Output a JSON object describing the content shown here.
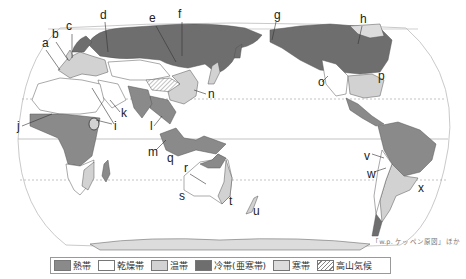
{
  "map": {
    "title": "Köppen climate zones world map",
    "projection": "Pacific-centered pseudo-cylindrical",
    "lines": [
      "equator",
      "tropic-of-cancer",
      "tropic-of-capricorn",
      "arctic-circle"
    ],
    "labels": [
      {
        "id": "a",
        "x": 42,
        "y": 47
      },
      {
        "id": "b",
        "x": 52,
        "y": 38
      },
      {
        "id": "c",
        "x": 69,
        "y": 30
      },
      {
        "id": "d",
        "x": 103,
        "y": 19
      },
      {
        "id": "e",
        "x": 152,
        "y": 22
      },
      {
        "id": "f",
        "x": 181,
        "y": 18
      },
      {
        "id": "g",
        "x": 276,
        "y": 19
      },
      {
        "id": "h",
        "x": 362,
        "y": 23
      },
      {
        "id": "i",
        "x": 114,
        "y": 128
      },
      {
        "id": "j",
        "x": 19,
        "y": 128
      },
      {
        "id": "k",
        "x": 123,
        "y": 115
      },
      {
        "id": "l",
        "x": 150,
        "y": 128
      },
      {
        "id": "m",
        "x": 152,
        "y": 154
      },
      {
        "id": "n",
        "x": 209,
        "y": 97
      },
      {
        "id": "o",
        "x": 320,
        "y": 86
      },
      {
        "id": "p",
        "x": 380,
        "y": 79
      },
      {
        "id": "q",
        "x": 167,
        "y": 161
      },
      {
        "id": "r",
        "x": 186,
        "y": 171
      },
      {
        "id": "s",
        "x": 180,
        "y": 200
      },
      {
        "id": "t",
        "x": 230,
        "y": 204
      },
      {
        "id": "u",
        "x": 253,
        "y": 214
      },
      {
        "id": "v",
        "x": 367,
        "y": 158
      },
      {
        "id": "w",
        "x": 370,
        "y": 176
      },
      {
        "id": "x",
        "x": 420,
        "y": 190
      }
    ],
    "credit": "「w.p. ケッペン原図」ほか"
  },
  "legend": {
    "items": [
      {
        "label": "熱帯",
        "color": "#8a8a8a",
        "pattern": "solid"
      },
      {
        "label": "乾燥帯",
        "color": "#ffffff",
        "pattern": "solid"
      },
      {
        "label": "温帯",
        "color": "#d2d2d2",
        "pattern": "solid"
      },
      {
        "label": "冷帯(亜寒帯)",
        "color": "#6e6e6e",
        "pattern": "solid"
      },
      {
        "label": "寒帯",
        "color": "#dcdcdc",
        "pattern": "solid"
      },
      {
        "label": "高山気候",
        "color": "#ffffff",
        "pattern": "hatch"
      }
    ]
  },
  "colors": {
    "tropical": "#8a8a8a",
    "arid": "#ffffff",
    "temperate": "#d2d2d2",
    "continental": "#6e6e6e",
    "polar": "#dcdcdc",
    "outline": "#555555",
    "frame": "#aaaaaa"
  }
}
